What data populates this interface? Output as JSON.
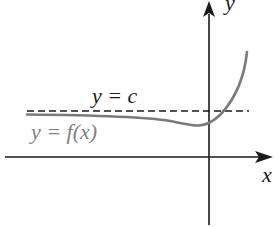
{
  "diagram": {
    "type": "function-graph",
    "axes": {
      "x_label": "x",
      "y_label": "y"
    },
    "labels": {
      "asymptote": "y = c",
      "curve": "y = f(x)"
    },
    "colors": {
      "axes": "#1a1a1a",
      "asymptote": "#1a1a1a",
      "curve": "#7a7a7a",
      "curve_label": "#808080",
      "text": "#1a1a1a"
    }
  }
}
